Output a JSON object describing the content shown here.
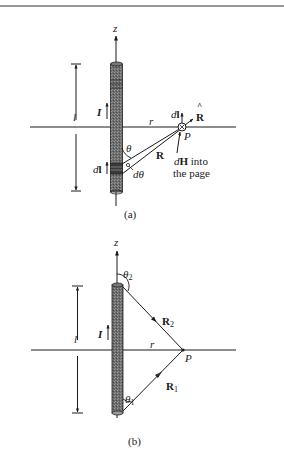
{
  "figure": {
    "panel_a": {
      "caption": "(a)",
      "axis_label": "z",
      "length_label": "l",
      "current_label": "I",
      "distance_label": "r",
      "point_label": "P",
      "vector_R_label": "R",
      "unit_vector_label": "R",
      "unit_vector_hat": "^",
      "dl_at_point_label": "dl",
      "dl_element_label": "dl",
      "angle_label": "θ",
      "dtheta_label": "dθ",
      "dH_label_line1_bold": "H",
      "dH_label_line1_d": "d",
      "dH_label_line1_rest": " into",
      "dH_label_line2": "the page"
    },
    "panel_b": {
      "caption": "(b)",
      "axis_label": "z",
      "length_label": "l",
      "current_label": "I",
      "distance_label": "r",
      "point_label": "P",
      "theta1_label": "θ",
      "theta1_sub": "1",
      "theta2_label": "θ",
      "theta2_sub": "2",
      "R1_label": "R",
      "R1_sub": "1",
      "R2_label": "R",
      "R2_sub": "2"
    }
  }
}
